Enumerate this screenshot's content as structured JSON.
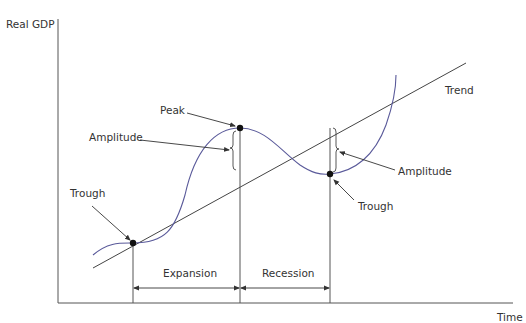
{
  "diagram": {
    "y_axis_label": "Real GDP",
    "x_axis_label": "Time",
    "trend_label": "Trend",
    "labels": {
      "peak": "Peak",
      "amplitude_left": "Amplitude",
      "amplitude_right": "Amplitude",
      "trough_left": "Trough",
      "trough_right": "Trough",
      "expansion": "Expansion",
      "recession": "Recession"
    },
    "colors": {
      "curve": "#5a5a9a",
      "lines": "#444444",
      "text": "#333333",
      "points": "#111111"
    }
  }
}
